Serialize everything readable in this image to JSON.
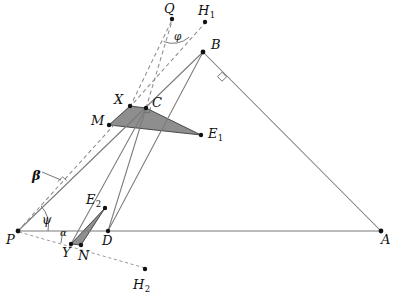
{
  "figure": {
    "kind": "euclidean-geometry-construction",
    "width": 399,
    "height": 305,
    "background_color": "#ffffff"
  },
  "style": {
    "solid_line_color": "#7a7a7a",
    "dashed_line_color": "#8d8d8d",
    "shade_fill_color": "#8e8e8e",
    "shade_stroke_color": "#3b3b3b",
    "dot_color": "#111111",
    "label_color": "#101010"
  },
  "points": {
    "Q": {
      "label": "Q",
      "sub": "",
      "x": 172,
      "y": 19,
      "label_x": 164,
      "label_y": 2,
      "dot": true
    },
    "H1": {
      "label": "H",
      "sub": "1",
      "x": 205,
      "y": 22,
      "label_x": 198,
      "label_y": 4,
      "dot": true
    },
    "B": {
      "label": "B",
      "sub": "",
      "x": 203,
      "y": 52,
      "label_x": 211,
      "label_y": 38,
      "dot": true
    },
    "X": {
      "label": "X",
      "sub": "",
      "x": 130,
      "y": 106,
      "label_x": 114,
      "label_y": 93,
      "dot": true
    },
    "C": {
      "label": "C",
      "sub": "",
      "x": 146,
      "y": 108,
      "label_x": 152,
      "label_y": 96,
      "dot": true
    },
    "M": {
      "label": "M",
      "sub": "",
      "x": 109,
      "y": 125,
      "label_x": 91,
      "label_y": 114,
      "dot": true
    },
    "E1": {
      "label": "E",
      "sub": "1",
      "x": 201,
      "y": 135,
      "label_x": 208,
      "label_y": 127,
      "dot": true
    },
    "E2": {
      "label": "E",
      "sub": "2",
      "x": 105,
      "y": 208,
      "label_x": 86,
      "label_y": 193,
      "dot": true
    },
    "P": {
      "label": "P",
      "sub": "",
      "x": 18,
      "y": 231,
      "label_x": 6,
      "label_y": 233,
      "dot": true
    },
    "D": {
      "label": "D",
      "sub": "",
      "x": 108,
      "y": 231,
      "label_x": 102,
      "label_y": 234,
      "dot": true
    },
    "A": {
      "label": "A",
      "sub": "",
      "x": 381,
      "y": 231,
      "label_x": 381,
      "label_y": 233,
      "dot": true
    },
    "Y": {
      "label": "Y",
      "sub": "",
      "x": 71,
      "y": 244,
      "label_x": 62,
      "label_y": 246,
      "dot": true
    },
    "N": {
      "label": "N",
      "sub": "",
      "x": 81,
      "y": 245,
      "label_x": 78,
      "label_y": 249,
      "dot": true
    },
    "H2": {
      "label": "H",
      "sub": "2",
      "x": 145,
      "y": 269,
      "label_x": 133,
      "label_y": 278,
      "dot": true
    }
  },
  "angle_labels": {
    "phi": {
      "symbol": "φ",
      "x": 174,
      "y": 31
    },
    "beta": {
      "symbol": "β",
      "x": 32,
      "y": 169
    },
    "psi": {
      "symbol": "ψ",
      "x": 42,
      "y": 214
    },
    "alpha": {
      "symbol": "α",
      "x": 60,
      "y": 228
    }
  },
  "segments": {
    "solid": [
      {
        "name": "segment-P-A",
        "from": "P",
        "to": "A"
      },
      {
        "name": "segment-P-B",
        "from": "P",
        "to": "B"
      },
      {
        "name": "segment-B-A",
        "from": "B",
        "to": "A"
      },
      {
        "name": "segment-D-B",
        "from": "D",
        "to": "B"
      },
      {
        "name": "segment-D-C",
        "from": "D",
        "to": "C"
      },
      {
        "name": "segment-Y-C",
        "from": "Y",
        "to": "C"
      }
    ],
    "dashed": [
      {
        "name": "dashed-P-X",
        "from": "P",
        "to": "X"
      },
      {
        "name": "dashed-X-Q",
        "from": "X",
        "to": "Q"
      },
      {
        "name": "dashed-C-Q",
        "from": "C",
        "to": "Q"
      },
      {
        "name": "dashed-X-H1",
        "from": "X",
        "to": "H1"
      },
      {
        "name": "dashed-P-N-H2",
        "from": "P",
        "to": "H2"
      }
    ]
  },
  "shaded_regions": [
    {
      "name": "shaded-triangle-upper",
      "vertices": [
        "M",
        "X",
        "C",
        "E1"
      ]
    },
    {
      "name": "shaded-triangle-lower",
      "vertices": [
        "E2",
        "N",
        "Y"
      ]
    }
  ],
  "right_angle_marks": [
    {
      "name": "right-angle-at-C",
      "x": 146,
      "y": 108
    },
    {
      "name": "right-angle-on-BA",
      "x": 222,
      "y": 77
    },
    {
      "name": "right-angle-on-PB",
      "x": 62,
      "y": 181
    }
  ]
}
